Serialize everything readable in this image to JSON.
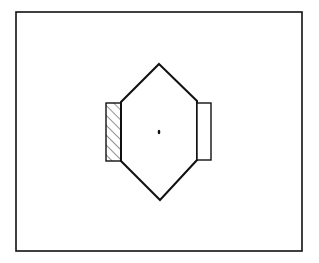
{
  "diagram": {
    "colors": {
      "background": "#ffffff",
      "stroke": "#111111"
    },
    "frame": {
      "x": 16,
      "y": 12,
      "width": 286,
      "height": 239
    },
    "hexagon": {
      "points": [
        [
          159,
          64
        ],
        [
          197,
          101
        ],
        [
          197,
          160
        ],
        [
          160,
          200
        ],
        [
          121,
          161
        ],
        [
          121,
          102
        ]
      ]
    },
    "left_block": {
      "x": 106,
      "y": 103,
      "width": 15,
      "height": 58,
      "fill": "hatched"
    },
    "right_block": {
      "x": 197,
      "y": 103,
      "width": 14,
      "height": 57,
      "fill": "none"
    },
    "center_dot": {
      "cx": 159,
      "cy": 132,
      "rx": 1.3,
      "ry": 2.3
    }
  }
}
